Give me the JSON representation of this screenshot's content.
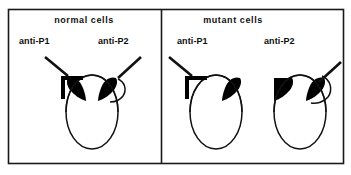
{
  "figure": {
    "kind": "immunolabeling-schematic",
    "frame": {
      "stroke_color": "#1a1a1a",
      "fill_color": "#ffffff",
      "x": 8,
      "y": 9,
      "width": 336,
      "height": 155,
      "divider_x": 161
    },
    "panels": [
      {
        "id": "normal",
        "title": "normal cells",
        "title_x": 84,
        "title_y": 20,
        "cells": [
          {
            "id": "normal-single-cell",
            "label_left": "anti-P1",
            "label_left_x": 19,
            "label_left_y": 41,
            "label_right": "anti-P2",
            "label_right_x": 98,
            "label_right_y": 41,
            "oval": {
              "cx": 92,
              "cy": 112,
              "rx": 26,
              "ry": 37
            },
            "caps": [
              "upper-left",
              "upper-right"
            ],
            "antibodies": [
              "left-bracket",
              "right-hook"
            ]
          }
        ]
      },
      {
        "id": "mutant",
        "title": "mutant cells",
        "title_x": 233,
        "title_y": 20,
        "cells": [
          {
            "id": "mutant-anti-p1-cell",
            "label": "anti-P1",
            "label_x": 177,
            "label_y": 41,
            "oval": {
              "cx": 216,
              "cy": 112,
              "rx": 26,
              "ry": 37
            },
            "caps": [
              "upper-right"
            ],
            "antibodies": [
              "left-bracket"
            ]
          },
          {
            "id": "mutant-anti-p2-cell",
            "label": "anti-P2",
            "label_x": 264,
            "label_y": 41,
            "oval": {
              "cx": 300,
              "cy": 112,
              "rx": 26,
              "ry": 37
            },
            "caps": [
              "upper-left",
              "upper-right"
            ],
            "antibodies": [
              "right-hook"
            ]
          }
        ]
      }
    ],
    "colors": {
      "ink": "#111111",
      "cap_fill": "#000000",
      "background": "#ffffff"
    }
  }
}
